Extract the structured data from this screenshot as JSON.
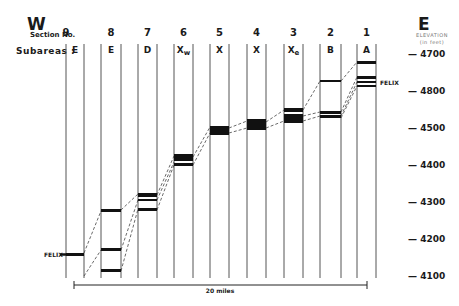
{
  "header": {
    "west": "W",
    "east": "E",
    "section_label": "Section No.",
    "subareas_label": "Subareas :",
    "elevation_label_line1": "ELEVATION",
    "elevation_label_line2": "(in feet)"
  },
  "columns": [
    {
      "section": "9",
      "subarea": "E",
      "sub": "",
      "x_left": 66,
      "x_right": 84
    },
    {
      "section": "8",
      "subarea": "E",
      "sub": "",
      "x_left": 101,
      "x_right": 121
    },
    {
      "section": "7",
      "subarea": "D",
      "sub": "",
      "x_left": 138,
      "x_right": 157
    },
    {
      "section": "6",
      "subarea": "X",
      "sub": "w",
      "x_left": 174,
      "x_right": 193
    },
    {
      "section": "5",
      "subarea": "X",
      "sub": "",
      "x_left": 210,
      "x_right": 229
    },
    {
      "section": "4",
      "subarea": "X",
      "sub": "",
      "x_left": 247,
      "x_right": 266
    },
    {
      "section": "3",
      "subarea": "X",
      "sub": "e",
      "x_left": 284,
      "x_right": 303
    },
    {
      "section": "2",
      "subarea": "B",
      "sub": "",
      "x_left": 320,
      "x_right": 341
    },
    {
      "section": "1",
      "subarea": "A",
      "sub": "",
      "x_left": 357,
      "x_right": 376
    }
  ],
  "axis": {
    "ticks": [
      {
        "label": "4700",
        "y": 55
      },
      {
        "label": "4800",
        "y": 92
      },
      {
        "label": "4500",
        "y": 129
      },
      {
        "label": "4400",
        "y": 166
      },
      {
        "label": "4300",
        "y": 203
      },
      {
        "label": "4200",
        "y": 240
      },
      {
        "label": "4100",
        "y": 277
      }
    ]
  },
  "felix_labels": [
    {
      "text": "FELIX",
      "x": 44,
      "y": 251
    },
    {
      "text": "FELIX",
      "x": 380,
      "y": 79
    }
  ],
  "scale_bar": {
    "label": "20 miles",
    "x1": 74,
    "x2": 367,
    "y": 285
  },
  "chart_data": {
    "type": "diagram",
    "ylabel": "ELEVATION (in feet)",
    "ylim": [
      4100,
      4700
    ],
    "bars": [
      {
        "section": "9",
        "y1": 253,
        "y2": 256
      },
      {
        "section": "8",
        "y1": 209,
        "y2": 212
      },
      {
        "section": "8",
        "y1": 248,
        "y2": 251
      },
      {
        "section": "8",
        "y1": 269,
        "y2": 272
      },
      {
        "section": "7",
        "y1": 193,
        "y2": 197
      },
      {
        "section": "7",
        "y1": 199,
        "y2": 201
      },
      {
        "section": "7",
        "y1": 208,
        "y2": 211
      },
      {
        "section": "6",
        "y1": 154,
        "y2": 161
      },
      {
        "section": "6",
        "y1": 163,
        "y2": 166
      },
      {
        "section": "5",
        "y1": 126,
        "y2": 135
      },
      {
        "section": "4",
        "y1": 119,
        "y2": 130
      },
      {
        "section": "3",
        "y1": 108,
        "y2": 112
      },
      {
        "section": "3",
        "y1": 114,
        "y2": 123
      },
      {
        "section": "2",
        "y1": 80,
        "y2": 82
      },
      {
        "section": "2",
        "y1": 111,
        "y2": 114
      },
      {
        "section": "2",
        "y1": 115,
        "y2": 118
      },
      {
        "section": "1",
        "y1": 61,
        "y2": 64
      },
      {
        "section": "1",
        "y1": 76,
        "y2": 79
      },
      {
        "section": "1",
        "y1": 81,
        "y2": 83
      },
      {
        "section": "1",
        "y1": 85,
        "y2": 87
      }
    ],
    "correlation_lines": [
      [
        [
          84,
          253
        ],
        [
          101,
          211
        ]
      ],
      [
        [
          84,
          276
        ],
        [
          101,
          250
        ]
      ],
      [
        [
          121,
          210
        ],
        [
          138,
          194
        ]
      ],
      [
        [
          121,
          250
        ],
        [
          138,
          200
        ]
      ],
      [
        [
          121,
          271
        ],
        [
          138,
          209
        ]
      ],
      [
        [
          157,
          195
        ],
        [
          174,
          156
        ]
      ],
      [
        [
          157,
          200
        ],
        [
          174,
          162
        ]
      ],
      [
        [
          157,
          210
        ],
        [
          174,
          165
        ]
      ],
      [
        [
          193,
          157
        ],
        [
          210,
          127
        ]
      ],
      [
        [
          193,
          165
        ],
        [
          210,
          133
        ]
      ],
      [
        [
          229,
          133
        ],
        [
          247,
          128
        ]
      ],
      [
        [
          229,
          128
        ],
        [
          247,
          121
        ]
      ],
      [
        [
          266,
          122
        ],
        [
          284,
          110
        ]
      ],
      [
        [
          266,
          128
        ],
        [
          284,
          121
        ]
      ],
      [
        [
          303,
          110
        ],
        [
          320,
          81
        ]
      ],
      [
        [
          303,
          121
        ],
        [
          320,
          116
        ]
      ],
      [
        [
          303,
          116
        ],
        [
          320,
          112
        ]
      ],
      [
        [
          341,
          81
        ],
        [
          357,
          62
        ]
      ],
      [
        [
          341,
          112
        ],
        [
          357,
          77
        ]
      ],
      [
        [
          341,
          116
        ],
        [
          357,
          82
        ]
      ],
      [
        [
          341,
          118
        ],
        [
          357,
          86
        ]
      ]
    ]
  }
}
